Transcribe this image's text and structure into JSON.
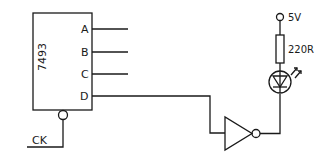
{
  "diagram": {
    "type": "circuit-schematic",
    "chip": {
      "label": "7493",
      "outputs": [
        "A",
        "B",
        "C",
        "D"
      ],
      "clock_input": "CK"
    },
    "supply": {
      "label": "5V"
    },
    "resistor": {
      "label": "220R"
    },
    "components": [
      "7493 counter",
      "inverter (NOT gate)",
      "LED",
      "220R resistor",
      "5V supply"
    ],
    "connections": [
      "CK -> 7493 clock input (active-low bubble)",
      "7493 D -> inverter input",
      "inverter output -> LED cathode",
      "LED anode -> 220R -> 5V"
    ],
    "line_color": "#1a1a1a"
  }
}
